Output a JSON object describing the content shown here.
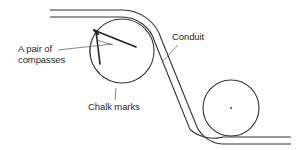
{
  "diagram": {
    "title": "",
    "labels": {
      "compasses_line1": "A pair of",
      "compasses_line2": "compasses",
      "conduit": "Conduit",
      "chalk_marks": "Chalk marks"
    },
    "elements": [
      {
        "name": "upper-drum",
        "type": "circle",
        "center": [
          122,
          51
        ],
        "radius": 32
      },
      {
        "name": "lower-drum",
        "type": "circle",
        "center": [
          231,
          108
        ],
        "radius": 28,
        "center_dot": true
      },
      {
        "name": "conduit",
        "type": "double-line-path",
        "description": "runs horizontally at top-left, wraps over upper drum, runs diagonally down, wraps under lower drum, exits horizontally bottom-right"
      },
      {
        "name": "compasses",
        "type": "drawing-tool",
        "location": "inside upper drum, left side"
      },
      {
        "name": "chalk-marks",
        "type": "arc",
        "location": "inner left arc of upper drum"
      }
    ],
    "colors": {
      "line": "#333333",
      "text": "#2a2a2a",
      "background": "#ffffff"
    }
  }
}
